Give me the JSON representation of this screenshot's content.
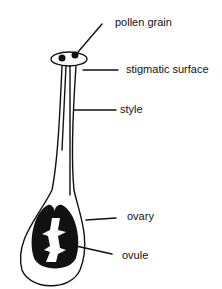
{
  "diagram": {
    "labels": {
      "pollen_grain": "pollen grain",
      "stigmatic_surface": "stigmatic surface",
      "style": "style",
      "ovary": "ovary",
      "ovule": "ovule"
    }
  }
}
